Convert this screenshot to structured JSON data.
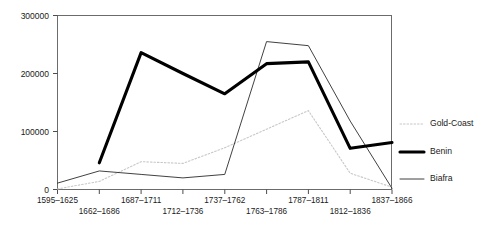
{
  "chart_data": {
    "type": "line",
    "title": "",
    "subtitle": "",
    "xlabel": "",
    "ylabel": "",
    "grid": false,
    "legend_position": "right",
    "ylim": [
      0,
      300000
    ],
    "ytick_labels": [
      "0",
      "100000",
      "200000",
      "300000"
    ],
    "ytick_values": [
      0,
      100000,
      200000,
      300000
    ],
    "categories": [
      "1595–1625",
      "1662–1686",
      "1687–1711",
      "1712–1736",
      "1737–1762",
      "1763–1786",
      "1787–1811",
      "1812–1836",
      "1837–1866"
    ],
    "categories_row_top": [
      "1595–1625",
      "1687–1711",
      "1737–1762",
      "1787–1811",
      "1837–1866"
    ],
    "categories_row_bottom": [
      "1662–1686",
      "1712–1736",
      "1763–1786",
      "1812–1836"
    ],
    "series": [
      {
        "name": "Gold-Coast",
        "style": "dotted",
        "color": "#c8c8c8",
        "values": [
          1000,
          14000,
          48000,
          45000,
          72000,
          104000,
          136000,
          28000,
          4000
        ]
      },
      {
        "name": "Benin",
        "style": "thick-solid",
        "color": "#000000",
        "values": [
          null,
          46000,
          236000,
          200000,
          165000,
          217000,
          220000,
          71000,
          81000
        ]
      },
      {
        "name": "Biafra",
        "style": "thin-solid",
        "color": "#2b2b2b",
        "values": [
          11000,
          32000,
          26000,
          20000,
          26000,
          255000,
          248000,
          118000,
          2000
        ]
      }
    ]
  },
  "legend": {
    "items": [
      {
        "label": "Gold-Coast",
        "swatch": "dotted-line-swatch"
      },
      {
        "label": "Benin",
        "swatch": "thick-line-swatch"
      },
      {
        "label": "Biafra",
        "swatch": "thin-line-swatch"
      }
    ]
  },
  "axis": {
    "y_ticks": [
      {
        "label": "300000"
      },
      {
        "label": "200000"
      },
      {
        "label": "100000"
      },
      {
        "label": "0"
      }
    ]
  }
}
